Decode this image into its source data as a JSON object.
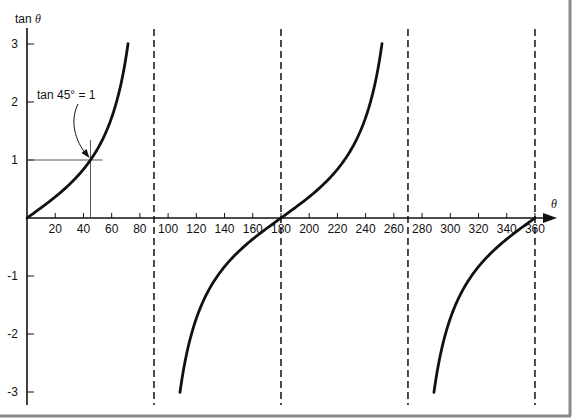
{
  "chart_data": {
    "type": "line",
    "title": "",
    "xlabel": "θ",
    "ylabel": "tan θ",
    "xlim": [
      0,
      370
    ],
    "ylim": [
      -3.2,
      3.2
    ],
    "grid": false,
    "legend": null,
    "x_ticks": [
      20,
      40,
      60,
      80,
      100,
      120,
      140,
      160,
      180,
      200,
      220,
      240,
      260,
      280,
      300,
      320,
      340,
      360
    ],
    "x_tick_labels": [
      "20",
      "40",
      "60",
      "80",
      "100",
      "120",
      "140",
      "160",
      "180",
      "200",
      "220",
      "240",
      "260",
      "280",
      "300",
      "320",
      "340",
      "360"
    ],
    "y_ticks": [
      3,
      2,
      1,
      -1,
      -2,
      -3
    ],
    "y_tick_labels": [
      "3",
      "2",
      "1",
      "-1",
      "-2",
      "-3"
    ],
    "asymptotes": [
      90,
      180,
      270,
      360
    ],
    "asymptote_style": "dashed",
    "series": [
      {
        "name": "tan θ branch 1",
        "x_range": [
          0,
          71.6
        ],
        "y_range": [
          0,
          3
        ]
      },
      {
        "name": "tan θ branch 2",
        "x_range": [
          108.4,
          251.6
        ],
        "y_range": [
          -3,
          3
        ]
      },
      {
        "name": "tan θ branch 3",
        "x_range": [
          288.4,
          360
        ],
        "y_range": [
          -3,
          0
        ]
      }
    ],
    "sample_points": [
      {
        "x": 0,
        "y": 0
      },
      {
        "x": 20,
        "y": 0.36
      },
      {
        "x": 45,
        "y": 1
      },
      {
        "x": 60,
        "y": 1.73
      },
      {
        "x": 71.6,
        "y": 3
      },
      {
        "x": 108.4,
        "y": -3
      },
      {
        "x": 135,
        "y": -1
      },
      {
        "x": 180,
        "y": 0
      },
      {
        "x": 225,
        "y": 1
      },
      {
        "x": 251.6,
        "y": 3
      },
      {
        "x": 288.4,
        "y": -3
      },
      {
        "x": 315,
        "y": -1
      },
      {
        "x": 360,
        "y": 0
      }
    ],
    "annotations": [
      {
        "text": "tan 45° = 1",
        "point": {
          "x": 45,
          "y": 1
        },
        "guides": "horizontal and vertical lines through point, arrow from label"
      }
    ]
  },
  "labels": {
    "y_axis_title": "tan θ",
    "x_axis_title": "θ",
    "annotation": "tan 45° = 1"
  },
  "colors": {
    "ink": "#111111",
    "guide": "#555555",
    "frame": "#8a8a8a",
    "background": "#ffffff"
  }
}
